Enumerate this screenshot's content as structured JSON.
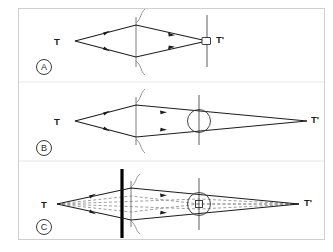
{
  "figure": {
    "background_color": "#ffffff",
    "frame_color": "#cfcfcf",
    "ray_color": "#1c1c1c",
    "dashed_ray_color": "#8d8d8d",
    "barrier_color": "#000000"
  },
  "panels": [
    {
      "id": "A",
      "letter": "A",
      "source_label": "T",
      "image_label": "T'",
      "elements": [
        "lens",
        "image-plane",
        "detector-rect"
      ],
      "ray_style": "solid",
      "has_aperture_circle": false,
      "has_barrier": false
    },
    {
      "id": "B",
      "letter": "B",
      "source_label": "T",
      "image_label": "T'",
      "elements": [
        "lens",
        "aperture-plane",
        "aperture-circle"
      ],
      "ray_style": "solid",
      "has_aperture_circle": true,
      "has_barrier": false
    },
    {
      "id": "C",
      "letter": "C",
      "source_label": "T",
      "image_label": "T'",
      "elements": [
        "barrier",
        "lens",
        "aperture-plane",
        "aperture-circle",
        "inner-square"
      ],
      "ray_style": "solid-and-dashed",
      "has_aperture_circle": true,
      "has_barrier": true
    }
  ]
}
